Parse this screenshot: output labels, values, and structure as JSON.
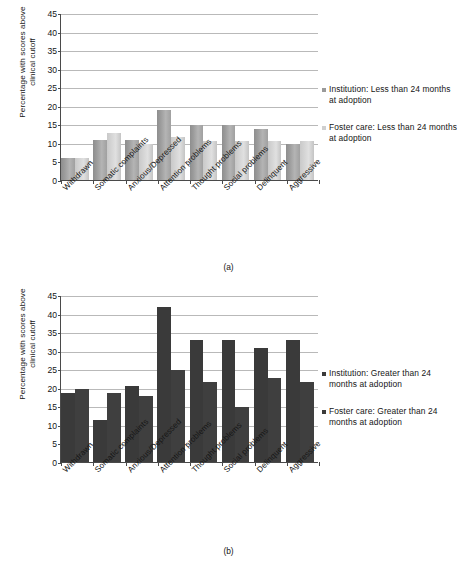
{
  "figure": {
    "panels": [
      {
        "caption": "(a)",
        "ylabel_lines": [
          "Percentage with scores above",
          "clinical cutoff"
        ],
        "legend": [
          "Institution: Less than 24 months at adoption",
          "Foster care: Less than 24 months at adoption"
        ]
      },
      {
        "caption": "(b)",
        "ylabel_lines": [
          "Percentage with scores above",
          "clinical cutoff"
        ],
        "legend": [
          "Institution: Greater than 24 months at adoption",
          "Foster care: Greater than 24 months at adoption"
        ]
      }
    ]
  },
  "chart_data": [
    {
      "type": "bar",
      "panel": "(a)",
      "title": "",
      "xlabel": "",
      "ylabel": "Percentage with scores above clinical cutoff",
      "ylim": [
        0,
        45
      ],
      "yticks": [
        0,
        5,
        10,
        15,
        20,
        25,
        30,
        35,
        40,
        45
      ],
      "grid": true,
      "legend_position": "right",
      "categories": [
        "Withdrawn",
        "Somatic complaints",
        "Anxious/Depressed",
        "Attention problems",
        "Thought problems",
        "Social problems",
        "Delinquent",
        "Aggressive"
      ],
      "series": [
        {
          "name": "Institution: Less than 24 months at adoption",
          "color": "#9a9a9a",
          "values": [
            5.9,
            10.7,
            10.7,
            18.8,
            14.9,
            14.9,
            13.7,
            9.8
          ]
        },
        {
          "name": "Foster care: Less than 24 months at adoption",
          "color": "#cfcfcf",
          "values": [
            5.9,
            12.7,
            9.8,
            11.7,
            10.6,
            10.6,
            10.6,
            10.4
          ]
        }
      ]
    },
    {
      "type": "bar",
      "panel": "(b)",
      "title": "",
      "xlabel": "",
      "ylabel": "Percentage with scores above clinical cutoff",
      "ylim": [
        0,
        45
      ],
      "yticks": [
        0,
        5,
        10,
        15,
        20,
        25,
        30,
        35,
        40,
        45
      ],
      "grid": true,
      "legend_position": "right",
      "categories": [
        "Withdrawn",
        "Somatic complaints",
        "Anxious/Depressed",
        "Attention problems",
        "Thought problems",
        "Social problems",
        "Delinquent",
        "Aggressive"
      ],
      "series": [
        {
          "name": "Institution: Greater than 24 months at adoption",
          "color": "#3a3a3a",
          "values": [
            18.6,
            11.4,
            20.6,
            41.7,
            32.8,
            32.8,
            30.8,
            32.8
          ]
        },
        {
          "name": "Foster care: Greater than 24 months at adoption",
          "color": "#3f3f3f",
          "values": [
            19.8,
            18.7,
            17.7,
            24.8,
            21.6,
            14.9,
            22.6,
            21.6
          ]
        }
      ]
    }
  ]
}
